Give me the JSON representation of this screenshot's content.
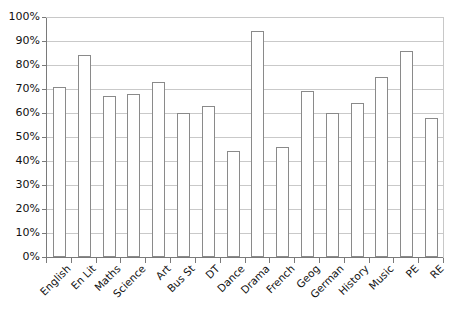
{
  "chart_data": {
    "type": "bar",
    "title": "",
    "subtitle": "",
    "xlabel": "",
    "ylabel": "",
    "ylim": [
      0,
      100
    ],
    "y_tick_labels": [
      "0%",
      "10%",
      "20%",
      "30%",
      "40%",
      "50%",
      "60%",
      "70%",
      "80%",
      "90%",
      "100%"
    ],
    "y_tick_values": [
      0,
      10,
      20,
      30,
      40,
      50,
      60,
      70,
      80,
      90,
      100
    ],
    "grid": "horizontal",
    "legend": "none",
    "categories": [
      "English",
      "En Lit",
      "Maths",
      "Science",
      "Art",
      "Bus St",
      "DT",
      "Dance",
      "Drama",
      "French",
      "Geog",
      "German",
      "History",
      "Music",
      "PE",
      "RE"
    ],
    "values": [
      71,
      84,
      67,
      68,
      73,
      60,
      63,
      44,
      94,
      46,
      69,
      60,
      64,
      75,
      86,
      58
    ],
    "value_suffix": "%",
    "bar_fill_color": "#ffffff",
    "bar_border_color": "#8a8a8a",
    "gridline_color": "#c9c9c9",
    "axis_color": "#7a7a7a",
    "background_color": "#ffffff"
  }
}
